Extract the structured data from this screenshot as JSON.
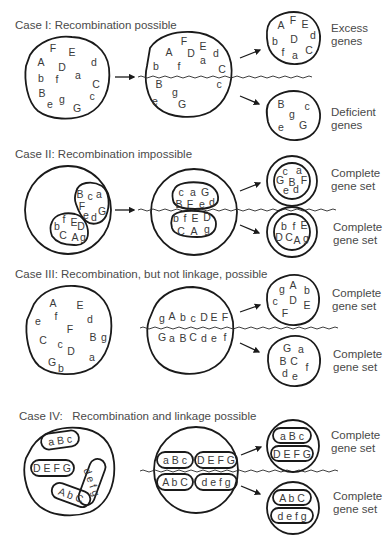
{
  "figure": {
    "cases": [
      {
        "title": "Case I: Recombination possible",
        "parent_genes": [
          {
            "t": "F",
            "x": 53,
            "y": 48
          },
          {
            "t": "E",
            "x": 72,
            "y": 52
          },
          {
            "t": "A",
            "x": 41,
            "y": 62
          },
          {
            "t": "D",
            "x": 62,
            "y": 67
          },
          {
            "t": "d",
            "x": 94,
            "y": 62
          },
          {
            "t": "a",
            "x": 78,
            "y": 75
          },
          {
            "t": "b",
            "x": 41,
            "y": 78
          },
          {
            "t": "f",
            "x": 57,
            "y": 79
          },
          {
            "t": "C",
            "x": 96,
            "y": 84
          },
          {
            "t": "B",
            "x": 42,
            "y": 93
          },
          {
            "t": "c",
            "x": 92,
            "y": 96
          },
          {
            "t": "e",
            "x": 50,
            "y": 104
          },
          {
            "t": "g",
            "x": 62,
            "y": 99
          },
          {
            "t": "G",
            "x": 77,
            "y": 108
          }
        ],
        "dividing_genes": [
          {
            "t": "F",
            "x": 184,
            "y": 41
          },
          {
            "t": "A",
            "x": 169,
            "y": 52
          },
          {
            "t": "D",
            "x": 191,
            "y": 53
          },
          {
            "t": "E",
            "x": 203,
            "y": 46
          },
          {
            "t": "d",
            "x": 216,
            "y": 53
          },
          {
            "t": "a",
            "x": 203,
            "y": 60
          },
          {
            "t": "b",
            "x": 156,
            "y": 66
          },
          {
            "t": "f",
            "x": 179,
            "y": 66
          },
          {
            "t": "C",
            "x": 222,
            "y": 69
          },
          {
            "t": "B",
            "x": 159,
            "y": 84
          },
          {
            "t": "c",
            "x": 219,
            "y": 84
          },
          {
            "t": "g",
            "x": 175,
            "y": 92
          },
          {
            "t": "e",
            "x": 155,
            "y": 101
          },
          {
            "t": "G",
            "x": 182,
            "y": 104
          }
        ],
        "upper_daughter_genes": [
          {
            "t": "A",
            "x": 281,
            "y": 25
          },
          {
            "t": "F",
            "x": 293,
            "y": 20
          },
          {
            "t": "E",
            "x": 305,
            "y": 24
          },
          {
            "t": "d",
            "x": 313,
            "y": 35
          },
          {
            "t": "b",
            "x": 275,
            "y": 41
          },
          {
            "t": "D",
            "x": 294,
            "y": 39
          },
          {
            "t": "f",
            "x": 283,
            "y": 52
          },
          {
            "t": "a",
            "x": 295,
            "y": 55
          },
          {
            "t": "C",
            "x": 309,
            "y": 50
          }
        ],
        "lower_daughter_genes": [
          {
            "t": "B",
            "x": 281,
            "y": 104
          },
          {
            "t": "c",
            "x": 307,
            "y": 106
          },
          {
            "t": "g",
            "x": 292,
            "y": 114
          },
          {
            "t": "e",
            "x": 281,
            "y": 127
          },
          {
            "t": "G",
            "x": 303,
            "y": 125
          }
        ],
        "upper_label": [
          "Excess",
          "genes"
        ],
        "lower_label": [
          "Deficient",
          "genes"
        ]
      },
      {
        "title": "Case II: Recombination impossible",
        "parent_upper_genes": [
          {
            "t": "B",
            "x": 80,
            "y": 194
          },
          {
            "t": "c",
            "x": 90,
            "y": 196
          },
          {
            "t": "a",
            "x": 99,
            "y": 194
          },
          {
            "t": "F",
            "x": 82,
            "y": 206
          },
          {
            "t": "e",
            "x": 86,
            "y": 215
          },
          {
            "t": "d",
            "x": 94,
            "y": 217
          },
          {
            "t": "G",
            "x": 102,
            "y": 211
          }
        ],
        "parent_lower_genes": [
          {
            "t": "b",
            "x": 57,
            "y": 226
          },
          {
            "t": "f",
            "x": 64,
            "y": 219
          },
          {
            "t": "E",
            "x": 74,
            "y": 222
          },
          {
            "t": "D",
            "x": 81,
            "y": 226
          },
          {
            "t": "C",
            "x": 63,
            "y": 235
          },
          {
            "t": "A",
            "x": 75,
            "y": 237
          },
          {
            "t": "g",
            "x": 83,
            "y": 237
          }
        ],
        "dividing_upper_genes": [
          {
            "t": "c",
            "x": 181,
            "y": 192
          },
          {
            "t": "a",
            "x": 193,
            "y": 192
          },
          {
            "t": "G",
            "x": 205,
            "y": 192
          },
          {
            "t": "B",
            "x": 179,
            "y": 204
          },
          {
            "t": "F",
            "x": 190,
            "y": 204
          },
          {
            "t": "e",
            "x": 202,
            "y": 204
          },
          {
            "t": "d",
            "x": 212,
            "y": 202
          }
        ],
        "dividing_lower_genes": [
          {
            "t": "b",
            "x": 176,
            "y": 218
          },
          {
            "t": "f",
            "x": 185,
            "y": 218
          },
          {
            "t": "E",
            "x": 195,
            "y": 218
          },
          {
            "t": "D",
            "x": 207,
            "y": 217
          },
          {
            "t": "C",
            "x": 181,
            "y": 231
          },
          {
            "t": "A",
            "x": 194,
            "y": 231
          },
          {
            "t": "g",
            "x": 207,
            "y": 229
          }
        ],
        "upper_daughter_genes": [
          {
            "t": "c",
            "x": 285,
            "y": 171
          },
          {
            "t": "a",
            "x": 299,
            "y": 170
          },
          {
            "t": "G",
            "x": 280,
            "y": 180
          },
          {
            "t": "B",
            "x": 292,
            "y": 182
          },
          {
            "t": "F",
            "x": 304,
            "y": 180
          },
          {
            "t": "e",
            "x": 286,
            "y": 190
          },
          {
            "t": "d",
            "x": 296,
            "y": 189
          }
        ],
        "lower_daughter_genes": [
          {
            "t": "b",
            "x": 284,
            "y": 226
          },
          {
            "t": "f",
            "x": 294,
            "y": 226
          },
          {
            "t": "E",
            "x": 304,
            "y": 225
          },
          {
            "t": "D",
            "x": 279,
            "y": 237
          },
          {
            "t": "C",
            "x": 289,
            "y": 237
          },
          {
            "t": "A",
            "x": 297,
            "y": 240
          },
          {
            "t": "g",
            "x": 306,
            "y": 238
          }
        ],
        "upper_label": [
          "Complete",
          "gene set"
        ],
        "lower_label": [
          "Complete",
          "gene set"
        ]
      },
      {
        "title": "Case III: Recombination, but not linkage, possible",
        "parent_genes": [
          {
            "t": "A",
            "x": 53,
            "y": 303
          },
          {
            "t": "E",
            "x": 80,
            "y": 305
          },
          {
            "t": "e",
            "x": 38,
            "y": 321
          },
          {
            "t": "f",
            "x": 56,
            "y": 316
          },
          {
            "t": "d",
            "x": 90,
            "y": 319
          },
          {
            "t": "F",
            "x": 70,
            "y": 329
          },
          {
            "t": "C",
            "x": 43,
            "y": 340
          },
          {
            "t": "c",
            "x": 60,
            "y": 344
          },
          {
            "t": "B",
            "x": 93,
            "y": 337
          },
          {
            "t": "g",
            "x": 104,
            "y": 337
          },
          {
            "t": "D",
            "x": 71,
            "y": 351
          },
          {
            "t": "a",
            "x": 92,
            "y": 357
          },
          {
            "t": "G",
            "x": 52,
            "y": 362
          },
          {
            "t": "b",
            "x": 61,
            "y": 368
          }
        ],
        "upper_row": [
          "g",
          "A",
          "b",
          "c",
          "D",
          "E",
          "F"
        ],
        "lower_row": [
          "G",
          "a",
          "B",
          "C",
          "d",
          "e",
          "f"
        ],
        "upper_daughter_genes": [
          {
            "t": "g",
            "x": 282,
            "y": 289
          },
          {
            "t": "A",
            "x": 293,
            "y": 285
          },
          {
            "t": "b",
            "x": 307,
            "y": 290
          },
          {
            "t": "c",
            "x": 275,
            "y": 301
          },
          {
            "t": "D",
            "x": 293,
            "y": 300
          },
          {
            "t": "E",
            "x": 307,
            "y": 305
          },
          {
            "t": "F",
            "x": 285,
            "y": 313
          }
        ],
        "lower_daughter_genes": [
          {
            "t": "G",
            "x": 287,
            "y": 348
          },
          {
            "t": "a",
            "x": 301,
            "y": 349
          },
          {
            "t": "B",
            "x": 283,
            "y": 361
          },
          {
            "t": "C",
            "x": 294,
            "y": 361
          },
          {
            "t": "f",
            "x": 307,
            "y": 367
          },
          {
            "t": "d",
            "x": 285,
            "y": 373
          },
          {
            "t": "e",
            "x": 295,
            "y": 376
          }
        ],
        "upper_label": [
          "Complete",
          "gene set"
        ],
        "lower_label": [
          "Complete",
          "gene set"
        ]
      },
      {
        "title": "Case IV:   Recombination and linkage possible",
        "parent_chromosomes": [
          "a B c",
          "D E F G",
          "d e f g",
          "A b C"
        ],
        "dividing_upper": [
          "a B c",
          "D E F G"
        ],
        "dividing_lower": [
          "A b C",
          "d e f g"
        ],
        "upper_daughter": [
          "a B c",
          "D E F G"
        ],
        "lower_daughter": [
          "A b C",
          "d e f g"
        ],
        "upper_label": [
          "Complete",
          "gene set"
        ],
        "lower_label": [
          "Complete",
          "gene set"
        ]
      }
    ]
  }
}
